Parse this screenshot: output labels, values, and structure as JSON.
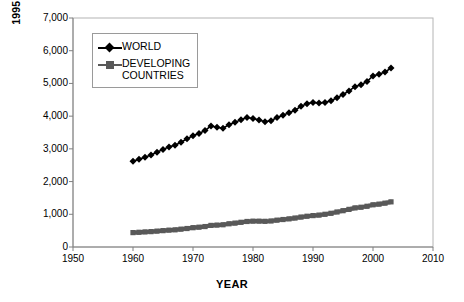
{
  "chart_data": {
    "type": "line",
    "title": "",
    "xlabel": "YEAR",
    "ylabel": "1995 U.S. $ PER PERSON",
    "xlim": [
      1950,
      2010
    ],
    "ylim": [
      0,
      7000
    ],
    "xticks": [
      1950,
      1960,
      1970,
      1980,
      1990,
      2000,
      2010
    ],
    "yticks": [
      "0",
      "1,000",
      "2,000",
      "3,000",
      "4,000",
      "5,000",
      "6,000",
      "7,000"
    ],
    "ytick_values": [
      0,
      1000,
      2000,
      3000,
      4000,
      5000,
      6000,
      7000
    ],
    "grid": false,
    "legend_position": "upper-left-inside",
    "x": [
      1960,
      1961,
      1962,
      1963,
      1964,
      1965,
      1966,
      1967,
      1968,
      1969,
      1970,
      1971,
      1972,
      1973,
      1974,
      1975,
      1976,
      1977,
      1978,
      1979,
      1980,
      1981,
      1982,
      1983,
      1984,
      1985,
      1986,
      1987,
      1988,
      1989,
      1990,
      1991,
      1992,
      1993,
      1994,
      1995,
      1996,
      1997,
      1998,
      1999,
      2000,
      2001,
      2002,
      2003
    ],
    "series": [
      {
        "name": "WORLD",
        "color": "#000000",
        "marker": "diamond",
        "values": [
          2620,
          2680,
          2740,
          2810,
          2900,
          2980,
          3060,
          3110,
          3200,
          3310,
          3400,
          3470,
          3560,
          3700,
          3660,
          3630,
          3740,
          3810,
          3890,
          3960,
          3930,
          3880,
          3830,
          3860,
          3960,
          4030,
          4100,
          4180,
          4300,
          4380,
          4420,
          4400,
          4420,
          4470,
          4560,
          4660,
          4770,
          4900,
          4960,
          5060,
          5230,
          5280,
          5350,
          5470
        ]
      },
      {
        "name": "DEVELOPING\nCOUNTRIES",
        "color": "#595959",
        "marker": "square",
        "values": [
          440,
          450,
          460,
          470,
          485,
          500,
          515,
          525,
          545,
          565,
          590,
          605,
          625,
          660,
          670,
          680,
          710,
          730,
          755,
          780,
          790,
          790,
          785,
          795,
          820,
          840,
          860,
          885,
          915,
          940,
          960,
          975,
          1000,
          1030,
          1070,
          1110,
          1150,
          1195,
          1215,
          1245,
          1290,
          1310,
          1340,
          1380
        ]
      }
    ]
  },
  "axis": {
    "x_title": "YEAR",
    "y_title": "1995 U.S. $ PER PERSON"
  },
  "legend": {
    "entries": [
      {
        "label": "WORLD",
        "marker": "diamond-marker",
        "color": "#000000"
      },
      {
        "label": "DEVELOPING\nCOUNTRIES",
        "marker": "square-marker",
        "color": "#595959"
      }
    ]
  }
}
